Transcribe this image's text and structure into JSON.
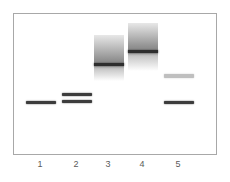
{
  "figure": {
    "type": "gel-electrophoresis",
    "background_color": "#ffffff",
    "frame": {
      "x": 13,
      "y": 13,
      "width": 204,
      "height": 142,
      "border_color": "#a8a8a8",
      "border_width": 1,
      "fill_color": "#ffffff"
    },
    "lane_label_color": "#5a5a5a",
    "lane_label_font_size": 9
  },
  "lanes": [
    {
      "id": "lane-1",
      "label": "1",
      "center_x": 40,
      "band_width": 30,
      "features": [
        {
          "kind": "band",
          "name": "lane-1-band-1",
          "y": 100,
          "height": 3,
          "color": "#3c3c3c",
          "intensity": "strong"
        }
      ]
    },
    {
      "id": "lane-2",
      "label": "2",
      "center_x": 76,
      "band_width": 30,
      "features": [
        {
          "kind": "band",
          "name": "lane-2-band-1",
          "y": 92,
          "height": 3,
          "color": "#3c3c3c",
          "intensity": "strong"
        },
        {
          "kind": "band",
          "name": "lane-2-band-2",
          "y": 99,
          "height": 3,
          "color": "#3c3c3c",
          "intensity": "strong"
        }
      ]
    },
    {
      "id": "lane-3",
      "label": "3",
      "center_x": 108,
      "band_width": 30,
      "features": [
        {
          "kind": "smear",
          "name": "lane-3-smear",
          "y": 34,
          "height": 46,
          "top_color": "#e8e8e8",
          "mid_color": "#8f8f8f",
          "bottom_color": "#ffffff",
          "dark_band_y": 62,
          "dark_band_height": 3,
          "dark_band_color": "#2e2e2e"
        }
      ]
    },
    {
      "id": "lane-4",
      "label": "4",
      "center_x": 142,
      "band_width": 30,
      "features": [
        {
          "kind": "smear",
          "name": "lane-4-smear",
          "y": 22,
          "height": 48,
          "top_color": "#e8e8e8",
          "mid_color": "#8f8f8f",
          "bottom_color": "#ffffff",
          "dark_band_y": 49,
          "dark_band_height": 3,
          "dark_band_color": "#2e2e2e"
        }
      ]
    },
    {
      "id": "lane-5",
      "label": "5",
      "center_x": 178,
      "band_width": 30,
      "features": [
        {
          "kind": "band",
          "name": "lane-5-band-1",
          "y": 73,
          "height": 4,
          "color": "#b4b4b4",
          "intensity": "faint"
        },
        {
          "kind": "band",
          "name": "lane-5-band-2",
          "y": 100,
          "height": 3,
          "color": "#3c3c3c",
          "intensity": "strong"
        }
      ]
    }
  ]
}
